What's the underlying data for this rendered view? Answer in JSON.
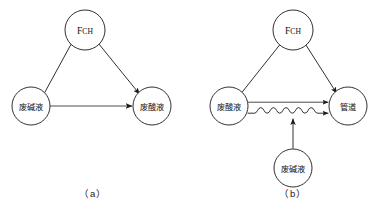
{
  "figure": {
    "background_color": "#ffffff",
    "stroke_color": "#1a1a1a",
    "panels": [
      {
        "id": "panel-a",
        "caption": "（a）",
        "caption_plain": "(a)",
        "nodes": [
          {
            "id": "a-top",
            "label": "FCH",
            "label_head": "F",
            "label_tail": "CH",
            "type": "roman",
            "cx": 85,
            "cy": 30,
            "r": 20
          },
          {
            "id": "a-left",
            "label": "废碱液",
            "type": "cjk",
            "cx": 31,
            "cy": 106,
            "r": 19
          },
          {
            "id": "a-right",
            "label": "废酸液",
            "type": "cjk",
            "cx": 152,
            "cy": 106,
            "r": 19
          }
        ],
        "edges": [
          {
            "from": "a-left",
            "to": "a-top",
            "style": "plain",
            "arrow": false
          },
          {
            "from": "a-top",
            "to": "a-right",
            "style": "plain",
            "arrow": true
          },
          {
            "from": "a-left",
            "to": "a-right",
            "style": "plain",
            "arrow": true
          }
        ]
      },
      {
        "id": "panel-b",
        "caption": "（b）",
        "caption_plain": "(b)",
        "nodes": [
          {
            "id": "b-top",
            "label": "FCH",
            "label_head": "F",
            "label_tail": "CH",
            "type": "roman",
            "cx": 293,
            "cy": 30,
            "r": 20
          },
          {
            "id": "b-left",
            "label": "废酸液",
            "type": "cjk",
            "cx": 229,
            "cy": 106,
            "r": 19
          },
          {
            "id": "b-right",
            "label": "管道",
            "type": "cjk",
            "cx": 348,
            "cy": 106,
            "r": 19
          },
          {
            "id": "b-bottom",
            "label": "废碱液",
            "type": "cjk",
            "cx": 293,
            "cy": 168,
            "r": 19
          }
        ],
        "edges": [
          {
            "from": "b-left",
            "to": "b-top",
            "style": "plain",
            "arrow": false
          },
          {
            "from": "b-top",
            "to": "b-right",
            "style": "plain",
            "arrow": true
          },
          {
            "from": "b-left",
            "to": "b-right",
            "style": "plain",
            "arrow": true
          },
          {
            "from": "b-left",
            "to": "b-right",
            "style": "wavy",
            "arrow": true
          },
          {
            "from": "b-bottom",
            "to": "wavy-midpoint",
            "style": "plain",
            "arrow": true
          }
        ]
      }
    ]
  },
  "labels": {
    "fch": "FCH",
    "fch_head": "F",
    "fch_tail": "CH",
    "waste_alkali": "废碱液",
    "waste_acid": "废酸液",
    "pipeline": "管道",
    "caption_a": "（a）",
    "caption_b": "（b）"
  }
}
